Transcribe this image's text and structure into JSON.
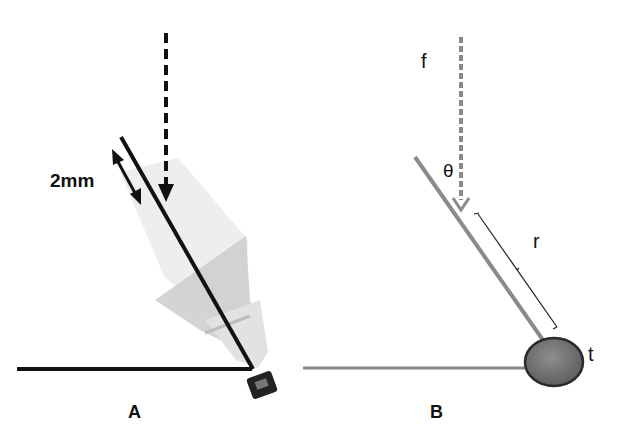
{
  "panels": [
    {
      "id": "A",
      "label": "A",
      "annotations": {
        "length_label": "2mm"
      },
      "description": "Shuttlecock tilted on floor with incident force arrow and 2mm offset"
    },
    {
      "id": "B",
      "label": "B",
      "annotations": {
        "force": "f",
        "angle": "θ",
        "radius": "r",
        "torque_point": "t"
      },
      "description": "Schematic of force f acting at angle θ at distance r from pivot t"
    }
  ],
  "colors": {
    "panel_a_lines": "#111111",
    "panel_b_lines": "#8a8a8a",
    "pivot_fill": "#777777",
    "pivot_stroke": "#2a2a2a",
    "shuttle_feather": "#cfcfcf"
  }
}
